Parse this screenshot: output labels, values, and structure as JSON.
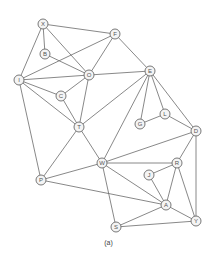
{
  "caption": "(a)",
  "style": {
    "edge_color": "#6a6a6a",
    "node_stroke": "#6a6a6a",
    "node_fill": "#f4f4f4",
    "label_color": "#555555",
    "node_radius": 5
  },
  "nodes": [
    {
      "id": "X",
      "x": 43,
      "y": 24
    },
    {
      "id": "F",
      "x": 115,
      "y": 34
    },
    {
      "id": "B",
      "x": 45,
      "y": 54
    },
    {
      "id": "O",
      "x": 89,
      "y": 75
    },
    {
      "id": "E",
      "x": 150,
      "y": 71
    },
    {
      "id": "I",
      "x": 19,
      "y": 80
    },
    {
      "id": "C",
      "x": 61,
      "y": 96
    },
    {
      "id": "G",
      "x": 140,
      "y": 124
    },
    {
      "id": "L",
      "x": 165,
      "y": 114
    },
    {
      "id": "T",
      "x": 79,
      "y": 127
    },
    {
      "id": "D",
      "x": 196,
      "y": 131
    },
    {
      "id": "W",
      "x": 102,
      "y": 163
    },
    {
      "id": "R",
      "x": 177,
      "y": 163
    },
    {
      "id": "J",
      "x": 149,
      "y": 175
    },
    {
      "id": "P",
      "x": 41,
      "y": 180
    },
    {
      "id": "A",
      "x": 166,
      "y": 205
    },
    {
      "id": "Y",
      "x": 196,
      "y": 221
    },
    {
      "id": "S",
      "x": 116,
      "y": 227
    }
  ],
  "edges": [
    [
      "X",
      "F"
    ],
    [
      "X",
      "B"
    ],
    [
      "X",
      "I"
    ],
    [
      "X",
      "O"
    ],
    [
      "B",
      "O"
    ],
    [
      "I",
      "F"
    ],
    [
      "I",
      "O"
    ],
    [
      "I",
      "C"
    ],
    [
      "I",
      "T"
    ],
    [
      "I",
      "P"
    ],
    [
      "F",
      "O"
    ],
    [
      "F",
      "E"
    ],
    [
      "O",
      "E"
    ],
    [
      "O",
      "C"
    ],
    [
      "O",
      "T"
    ],
    [
      "C",
      "T"
    ],
    [
      "T",
      "E"
    ],
    [
      "T",
      "W"
    ],
    [
      "T",
      "P"
    ],
    [
      "E",
      "W"
    ],
    [
      "E",
      "G"
    ],
    [
      "E",
      "L"
    ],
    [
      "E",
      "D"
    ],
    [
      "G",
      "L"
    ],
    [
      "L",
      "D"
    ],
    [
      "W",
      "P"
    ],
    [
      "W",
      "D"
    ],
    [
      "W",
      "R"
    ],
    [
      "W",
      "A"
    ],
    [
      "W",
      "S"
    ],
    [
      "P",
      "A"
    ],
    [
      "D",
      "R"
    ],
    [
      "D",
      "Y"
    ],
    [
      "R",
      "J"
    ],
    [
      "R",
      "A"
    ],
    [
      "R",
      "Y"
    ],
    [
      "J",
      "A"
    ],
    [
      "A",
      "Y"
    ],
    [
      "A",
      "S"
    ],
    [
      "S",
      "Y"
    ]
  ]
}
